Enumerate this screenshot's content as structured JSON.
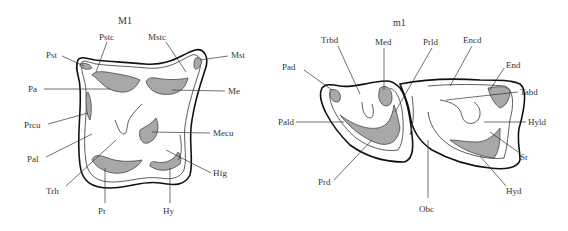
{
  "figures": [
    {
      "id": "upper-first-molar",
      "title": "M1",
      "labels": {
        "Pstc": "Pstc",
        "Mstc": "Mstc",
        "Pst": "Pst",
        "Mst": "Mst",
        "Pa": "Pa",
        "Me": "Me",
        "Prcu": "Prcu",
        "Mecu": "Mecu",
        "Pal": "Pal",
        "Hfg": "Hfg",
        "Trh": "Trh",
        "Pr": "Pr",
        "Hy": "Hy"
      }
    },
    {
      "id": "lower-first-molar",
      "title": "m1",
      "labels": {
        "Trbd": "Trbd",
        "Med": "Med",
        "Prld": "Prld",
        "Encd": "Encd",
        "Pad": "Pad",
        "End": "End",
        "Tabd": "Tabd",
        "Pald": "Pald",
        "Hyld": "Hyld",
        "Sr": "Sr",
        "Prd": "Prd",
        "Hyd": "Hyd",
        "Obc": "Obc"
      }
    }
  ],
  "colors": {
    "outline": "#111111",
    "shading": "#a8a8a8",
    "text": "#333333",
    "background": "#ffffff"
  }
}
